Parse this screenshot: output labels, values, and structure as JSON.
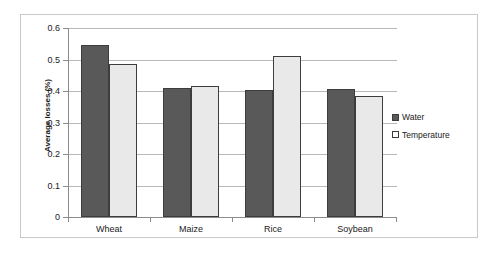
{
  "chart_data": {
    "type": "bar",
    "title": "",
    "xlabel": "",
    "ylabel": "Average losses (%)",
    "categories": [
      "Wheat",
      "Maize",
      "Rice",
      "Soybean"
    ],
    "series": [
      {
        "name": "Water",
        "values": [
          0.545,
          0.408,
          0.403,
          0.405
        ],
        "color": "#595959"
      },
      {
        "name": "Temperature",
        "values": [
          0.487,
          0.417,
          0.511,
          0.383
        ],
        "color": "#e9e9e9"
      }
    ],
    "ylim": [
      0,
      0.6
    ],
    "ytick_labels": [
      "0",
      "0.1",
      "0.2",
      "0.3",
      "0.4",
      "0.5",
      "0.6"
    ],
    "ytick_values": [
      0,
      0.1,
      0.2,
      0.3,
      0.4,
      0.5,
      0.6
    ],
    "grid": true,
    "legend_position": "right"
  },
  "legend": {
    "entries": [
      {
        "label": "Water"
      },
      {
        "label": "Temperature"
      }
    ]
  }
}
